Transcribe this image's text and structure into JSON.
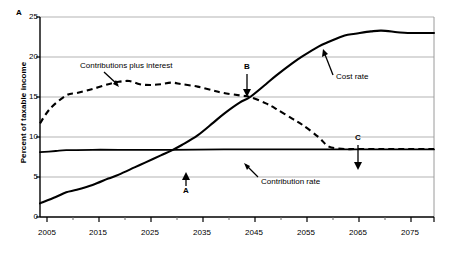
{
  "panel": {
    "label": "A"
  },
  "axes": {
    "ylabel": "Percent of taxable income",
    "yticks": [
      "0",
      "5",
      "10",
      "15",
      "20",
      "25"
    ],
    "xticks": [
      "2005",
      "2015",
      "2025",
      "2035",
      "2045",
      "2055",
      "2065",
      "2075"
    ],
    "xlabel": ""
  },
  "annotations": {
    "contributions_plus_interest": "Contributions plus interest",
    "cost_rate": "Cost rate",
    "contribution_rate": "Contribution rate",
    "marker_a": "A",
    "marker_b": "B",
    "marker_c": "C"
  },
  "colors": {
    "line": "#000000",
    "grid": "#b3b3b3",
    "frame": "#808080",
    "background": "#ffffff"
  },
  "chart_data": {
    "type": "line",
    "title": "",
    "xlabel": "",
    "ylabel": "Percent of taxable income",
    "xlim": [
      2005,
      2080
    ],
    "ylim": [
      0,
      25
    ],
    "grid": true,
    "legend": "none (inline labels with arrows)",
    "xticks": [
      2005,
      2015,
      2025,
      2035,
      2045,
      2055,
      2065,
      2075
    ],
    "yticks": [
      0,
      5,
      10,
      15,
      20,
      25
    ],
    "minor_xtick_interval": 5,
    "series": [
      {
        "name": "Cost rate",
        "style": "solid",
        "x": [
          2005,
          2008,
          2010,
          2012,
          2015,
          2018,
          2020,
          2023,
          2025,
          2028,
          2030,
          2032,
          2035,
          2038,
          2040,
          2043,
          2045,
          2048,
          2050,
          2053,
          2055,
          2058,
          2060,
          2063,
          2065,
          2068,
          2070,
          2073,
          2075,
          2078,
          2080
        ],
        "values": [
          1.7,
          2.5,
          3.1,
          3.4,
          4.0,
          4.8,
          5.3,
          6.2,
          6.8,
          7.7,
          8.3,
          9.0,
          10.2,
          11.8,
          12.9,
          14.3,
          15.0,
          16.6,
          17.7,
          19.2,
          20.1,
          21.3,
          21.9,
          22.7,
          22.9,
          23.2,
          23.3,
          23.1,
          23.0,
          23.0,
          23.0
        ]
      },
      {
        "name": "Contributions plus interest",
        "style": "dashed",
        "x": [
          2005,
          2007,
          2010,
          2012,
          2015,
          2018,
          2020,
          2022,
          2024,
          2026,
          2028,
          2030,
          2032,
          2035,
          2038,
          2040,
          2043,
          2045,
          2048,
          2050,
          2053,
          2055,
          2058,
          2060,
          2063,
          2065,
          2070,
          2075,
          2080
        ],
        "values": [
          11.7,
          13.6,
          15.2,
          15.5,
          16.0,
          16.6,
          16.9,
          17.0,
          16.6,
          16.5,
          16.6,
          16.8,
          16.6,
          16.3,
          15.8,
          15.5,
          15.2,
          15.0,
          14.2,
          13.5,
          12.3,
          11.5,
          10.0,
          8.8,
          8.5,
          8.5,
          8.5,
          8.5,
          8.5
        ]
      },
      {
        "name": "Contribution rate",
        "style": "solid",
        "x": [
          2005,
          2008,
          2010,
          2015,
          2020,
          2030,
          2040,
          2050,
          2060,
          2070,
          2080
        ],
        "values": [
          8.1,
          8.25,
          8.35,
          8.4,
          8.4,
          8.4,
          8.45,
          8.45,
          8.45,
          8.45,
          8.45
        ]
      }
    ],
    "markers": [
      {
        "label": "A",
        "x": 2031,
        "y": 8.4,
        "note": "Cost rate crosses contribution rate"
      },
      {
        "label": "B",
        "x": 2045,
        "y": 15.0,
        "note": "Cost rate crosses contributions plus interest"
      },
      {
        "label": "C",
        "x": 2060,
        "y": 8.5,
        "note": "Contributions plus interest falls to contribution rate"
      }
    ]
  }
}
